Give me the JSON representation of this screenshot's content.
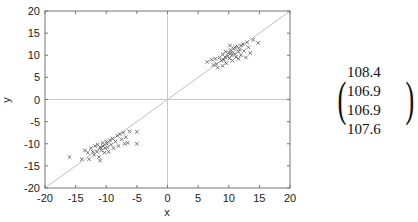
{
  "chart_data": {
    "type": "scatter",
    "title": "",
    "xlabel": "x",
    "ylabel": "y",
    "xlim": [
      -20,
      20
    ],
    "ylim": [
      -20,
      20
    ],
    "xticks": [
      -20,
      -15,
      -10,
      -5,
      0,
      5,
      10,
      15,
      20
    ],
    "yticks": [
      -20,
      -15,
      -10,
      -5,
      0,
      5,
      10,
      15,
      20
    ],
    "grid": false,
    "reference_lines": [
      {
        "type": "diagonal",
        "equation": "y = x"
      },
      {
        "type": "horizontal",
        "y": 0
      },
      {
        "type": "vertical",
        "x": 0
      }
    ],
    "marker": "x",
    "series": [
      {
        "name": "cluster-positive",
        "points": [
          [
            6.5,
            8.5
          ],
          [
            7.5,
            7.8
          ],
          [
            7.8,
            9.2
          ],
          [
            8.2,
            7.2
          ],
          [
            8.5,
            9.5
          ],
          [
            8.8,
            8.8
          ],
          [
            9.0,
            10.2
          ],
          [
            9.2,
            9.0
          ],
          [
            9.5,
            10.8
          ],
          [
            9.6,
            8.2
          ],
          [
            9.8,
            9.8
          ],
          [
            10.0,
            10.5
          ],
          [
            10.1,
            9.3
          ],
          [
            10.3,
            11.2
          ],
          [
            10.5,
            10.0
          ],
          [
            10.6,
            8.8
          ],
          [
            10.8,
            11.5
          ],
          [
            11.0,
            10.3
          ],
          [
            11.2,
            9.6
          ],
          [
            11.4,
            12.0
          ],
          [
            11.6,
            10.8
          ],
          [
            11.8,
            11.3
          ],
          [
            12.0,
            10.0
          ],
          [
            12.3,
            12.5
          ],
          [
            12.5,
            11.0
          ],
          [
            12.8,
            9.5
          ],
          [
            13.2,
            11.8
          ],
          [
            13.5,
            10.5
          ],
          [
            14.0,
            13.5
          ],
          [
            14.8,
            12.8
          ],
          [
            8.0,
            8.0
          ],
          [
            9.4,
            9.6
          ],
          [
            10.4,
            10.6
          ],
          [
            11.0,
            11.8
          ],
          [
            12.0,
            12.2
          ],
          [
            7.2,
            9.0
          ],
          [
            9.0,
            7.6
          ],
          [
            10.2,
            12.2
          ],
          [
            11.6,
            9.2
          ],
          [
            13.0,
            12.9
          ]
        ]
      },
      {
        "name": "cluster-negative",
        "points": [
          [
            -16.0,
            -13.0
          ],
          [
            -14.0,
            -13.5
          ],
          [
            -13.5,
            -11.5
          ],
          [
            -13.0,
            -12.0
          ],
          [
            -12.8,
            -13.5
          ],
          [
            -12.5,
            -11.0
          ],
          [
            -12.0,
            -12.5
          ],
          [
            -11.8,
            -10.5
          ],
          [
            -11.5,
            -11.8
          ],
          [
            -11.2,
            -13.0
          ],
          [
            -11.0,
            -10.8
          ],
          [
            -10.8,
            -11.5
          ],
          [
            -10.6,
            -9.8
          ],
          [
            -10.5,
            -10.5
          ],
          [
            -10.3,
            -12.0
          ],
          [
            -10.2,
            -11.0
          ],
          [
            -10.0,
            -9.5
          ],
          [
            -9.8,
            -10.8
          ],
          [
            -9.6,
            -11.8
          ],
          [
            -9.4,
            -9.2
          ],
          [
            -9.2,
            -10.2
          ],
          [
            -9.0,
            -8.8
          ],
          [
            -8.8,
            -11.0
          ],
          [
            -8.5,
            -9.5
          ],
          [
            -8.2,
            -8.2
          ],
          [
            -8.0,
            -10.5
          ],
          [
            -7.8,
            -7.8
          ],
          [
            -7.5,
            -9.0
          ],
          [
            -7.2,
            -7.5
          ],
          [
            -7.0,
            -10.0
          ],
          [
            -6.8,
            -8.5
          ],
          [
            -6.5,
            -9.8
          ],
          [
            -6.2,
            -7.2
          ],
          [
            -5.0,
            -7.3
          ],
          [
            -5.0,
            -10.0
          ],
          [
            -11.0,
            -13.8
          ],
          [
            -12.2,
            -11.8
          ],
          [
            -10.9,
            -10.9
          ],
          [
            -11.4,
            -10.2
          ],
          [
            -9.9,
            -10.0
          ]
        ]
      }
    ]
  },
  "annotation": {
    "type": "covariance-matrix",
    "rows": [
      [
        "108.4",
        "106.9"
      ],
      [
        "106.9",
        "107.6"
      ]
    ]
  }
}
